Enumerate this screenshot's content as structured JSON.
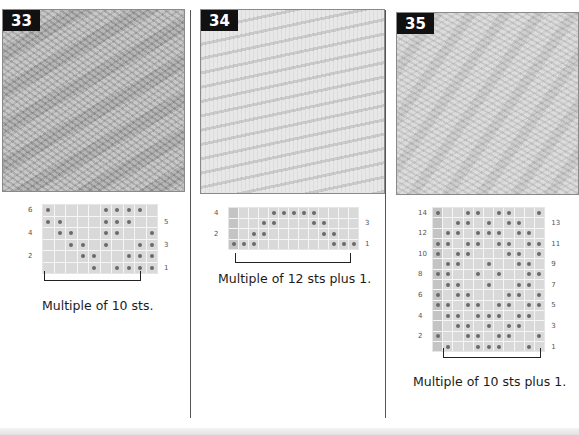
{
  "page": {
    "background": "#ffffff"
  },
  "patterns": [
    {
      "number": "33",
      "caption": "Multiple of 10 sts.",
      "photo_tone": "#b9b9b9",
      "chart": {
        "columns": 10,
        "rows": 6,
        "edge_column": false,
        "left_labels": [
          "6",
          "4",
          "2"
        ],
        "right_labels": [
          "5",
          "3",
          "1"
        ],
        "dots_by_row": {
          "6": [
            1,
            6,
            7,
            8,
            9
          ],
          "5": [
            1,
            2,
            6,
            7,
            8
          ],
          "4": [
            2,
            3,
            6,
            7,
            10
          ],
          "3": [
            3,
            4,
            6,
            9,
            10
          ],
          "2": [
            4,
            5,
            8,
            9,
            10
          ],
          "1": [
            5,
            7,
            8,
            9,
            10
          ]
        }
      }
    },
    {
      "number": "34",
      "caption": "Multiple of 12 sts plus 1.",
      "photo_tone": "#dedede",
      "chart": {
        "columns": 13,
        "rows": 4,
        "edge_column": true,
        "left_labels": [
          "4",
          "2"
        ],
        "right_labels": [
          "3",
          "1"
        ],
        "dots_by_row": {
          "4": [
            5,
            6,
            7,
            8,
            9
          ],
          "3": [
            4,
            5,
            9,
            10
          ],
          "2": [
            3,
            4,
            10,
            11
          ],
          "1": [
            1,
            2,
            3,
            11,
            12,
            13
          ]
        }
      }
    },
    {
      "number": "35",
      "caption": "Multiple of 10 sts plus 1.",
      "photo_tone": "#d4d4d4",
      "chart": {
        "columns": 11,
        "rows": 14,
        "edge_column": true,
        "left_labels": [
          "14",
          "12",
          "10",
          "8",
          "6",
          "4",
          "2"
        ],
        "right_labels": [
          "13",
          "11",
          "9",
          "7",
          "5",
          "3",
          "1"
        ],
        "dots_by_row": {
          "14": [
            1,
            4,
            5,
            7,
            8,
            11
          ],
          "13": [
            3,
            4,
            6,
            8,
            9
          ],
          "12": [
            2,
            3,
            5,
            6,
            7,
            9,
            10
          ],
          "11": [
            1,
            2,
            4,
            5,
            7,
            8,
            10,
            11
          ],
          "10": [
            1,
            3,
            4,
            8,
            9,
            11
          ],
          "9": [
            2,
            3,
            6,
            9,
            10
          ],
          "8": [
            1,
            2,
            5,
            7,
            10,
            11
          ],
          "7": [
            2,
            3,
            6,
            9,
            10
          ],
          "6": [
            1,
            3,
            4,
            8,
            9,
            11
          ],
          "5": [
            1,
            2,
            4,
            5,
            7,
            8,
            10,
            11
          ],
          "4": [
            2,
            3,
            5,
            6,
            7,
            9,
            10
          ],
          "3": [
            3,
            4,
            6,
            8,
            9
          ],
          "2": [
            1,
            4,
            5,
            7,
            8,
            11
          ],
          "1": [
            2,
            5,
            6,
            7,
            10
          ]
        }
      }
    }
  ]
}
